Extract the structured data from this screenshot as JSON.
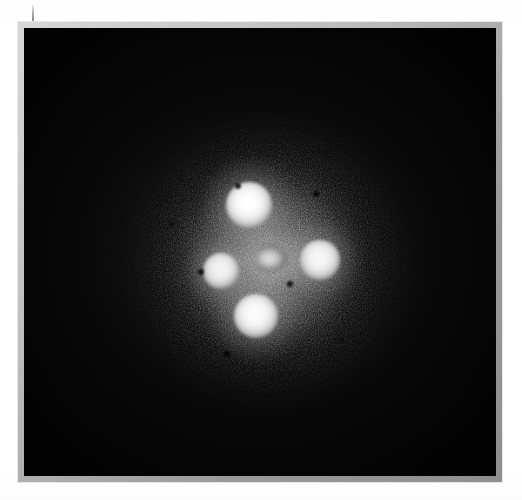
{
  "page": {
    "background_color": "#ffffff",
    "width": 522,
    "height": 500,
    "margin_tick_label": ""
  },
  "frame": {
    "border_color": "#9a9a9a",
    "highlight_color": "#d8d8d8",
    "plate_background": "#050505",
    "left": 18,
    "top": 22,
    "width": 484,
    "height": 460
  },
  "image": {
    "caption": "",
    "subject": "gravitationally lensed quasar — Einstein Cross",
    "modality": "grayscale astronomical plate",
    "field_background_color": "#050505",
    "halo_color": "#848484",
    "source_color": "#ffffff"
  },
  "chart_data": {
    "type": "scatter",
    "title": "",
    "xlabel": "",
    "ylabel": "",
    "xlim": [
      0,
      472
    ],
    "ylim": [
      0,
      448
    ],
    "grid": false,
    "legend": "none",
    "series": [
      {
        "name": "lensed quasar images",
        "points": [
          {
            "id": "A",
            "label": "north image",
            "x": 225,
            "y": 177,
            "radius": 23,
            "brightness": 1.0
          },
          {
            "id": "B",
            "label": "west image",
            "x": 197,
            "y": 243,
            "radius": 18,
            "brightness": 0.92
          },
          {
            "id": "C",
            "label": "east image",
            "x": 296,
            "y": 232,
            "radius": 20,
            "brightness": 0.95
          },
          {
            "id": "D",
            "label": "south image",
            "x": 232,
            "y": 288,
            "radius": 22,
            "brightness": 0.98
          },
          {
            "id": "G",
            "label": "lens galaxy nucleus",
            "x": 247,
            "y": 233,
            "radius": 17,
            "brightness": 0.74
          }
        ]
      },
      {
        "name": "diffuse halo",
        "points": [
          {
            "id": "halo",
            "label": "lens galaxy envelope",
            "x": 243,
            "y": 232,
            "radius": 135,
            "brightness": 0.36
          }
        ]
      },
      {
        "name": "emulsion specks",
        "points": [
          {
            "id": "s1",
            "x": 214,
            "y": 158,
            "radius": 3
          },
          {
            "id": "s2",
            "x": 292,
            "y": 166,
            "radius": 3
          },
          {
            "id": "s3",
            "x": 177,
            "y": 244,
            "radius": 3
          },
          {
            "id": "s4",
            "x": 266,
            "y": 256,
            "radius": 3
          },
          {
            "id": "s5",
            "x": 203,
            "y": 326,
            "radius": 3
          },
          {
            "id": "s6",
            "x": 318,
            "y": 312,
            "radius": 2
          },
          {
            "id": "s7",
            "x": 148,
            "y": 196,
            "radius": 2
          }
        ]
      }
    ]
  }
}
